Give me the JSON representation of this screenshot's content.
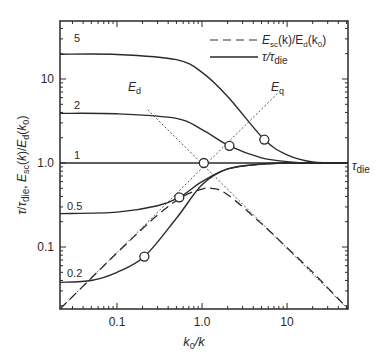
{
  "chart_data": {
    "type": "line",
    "title": "",
    "xlabel": "k0/k",
    "ylabel": "τ/τdie, Esc(k)/Ed(k0)",
    "xscale": "log",
    "yscale": "log",
    "xlim": [
      0.0214,
      52
    ],
    "ylim": [
      0.0183,
      49
    ],
    "grid": false,
    "legend_position": "upper right",
    "x_ticks": [
      {
        "value": 0.1,
        "label": "0.1"
      },
      {
        "value": 1.0,
        "label": "1.0"
      },
      {
        "value": 10,
        "label": "10"
      }
    ],
    "y_ticks": [
      {
        "value": 0.1,
        "label": "0.1"
      },
      {
        "value": 1.0,
        "label": "1.0"
      },
      {
        "value": 10,
        "label": "10"
      }
    ],
    "legend": [
      {
        "label": "Esc(k)/Ed(k0)",
        "style": "dashed"
      },
      {
        "label": "τ/τdie",
        "style": "solid"
      }
    ],
    "series": [
      {
        "name": "τ/τdie (5)",
        "style": "solid",
        "label": "5",
        "initial_value": 19.7,
        "final_value": 1.0,
        "x": [
          0.0214,
          0.1,
          0.5,
          1.0,
          2.0,
          5.4,
          10,
          20,
          52
        ],
        "y": [
          19.7,
          19.6,
          17.0,
          12.0,
          6.2,
          1.9,
          1.25,
          1.03,
          1.0
        ],
        "marker": {
          "x": 5.4,
          "y": 1.9
        }
      },
      {
        "name": "τ/τdie (2)",
        "style": "solid",
        "label": "2",
        "initial_value": 3.9,
        "final_value": 1.0,
        "x": [
          0.0214,
          0.1,
          0.5,
          1.0,
          2.1,
          5,
          10,
          20,
          52
        ],
        "y": [
          3.9,
          3.85,
          3.4,
          2.5,
          1.6,
          1.15,
          1.04,
          1.0,
          1.0
        ],
        "marker": {
          "x": 2.1,
          "y": 1.6
        }
      },
      {
        "name": "τ/τdie (1)",
        "style": "solid",
        "label": "1",
        "initial_value": 1.0,
        "final_value": 1.0,
        "x": [
          0.0214,
          1.0,
          52
        ],
        "y": [
          1.0,
          1.0,
          1.0
        ],
        "marker": {
          "x": 1.05,
          "y": 1.0
        }
      },
      {
        "name": "τ/τdie (0.5)",
        "style": "solid",
        "label": "0.5",
        "initial_value": 0.25,
        "final_value": 1.0,
        "x": [
          0.0214,
          0.1,
          0.3,
          0.54,
          1.0,
          2.0,
          5,
          10,
          52
        ],
        "y": [
          0.25,
          0.26,
          0.31,
          0.39,
          0.6,
          0.85,
          0.97,
          1.0,
          1.0
        ],
        "marker": {
          "x": 0.54,
          "y": 0.39
        }
      },
      {
        "name": "τ/τdie (0.2)",
        "style": "solid",
        "label": "0.2",
        "initial_value": 0.038,
        "final_value": 1.0,
        "x": [
          0.0214,
          0.05,
          0.1,
          0.21,
          0.5,
          1.0,
          2.0,
          5,
          10,
          52
        ],
        "y": [
          0.038,
          0.04,
          0.05,
          0.077,
          0.22,
          0.55,
          0.85,
          0.97,
          1.0,
          1.0
        ],
        "marker": {
          "x": 0.21,
          "y": 0.077
        }
      },
      {
        "name": "Esc(k)/Ed(k0)",
        "style": "dashed",
        "x": [
          0.0214,
          0.1,
          0.3,
          0.6,
          1.0,
          1.3,
          2.0,
          5,
          10,
          20,
          52
        ],
        "y": [
          0.0183,
          0.085,
          0.24,
          0.4,
          0.49,
          0.5,
          0.42,
          0.19,
          0.098,
          0.05,
          0.0183
        ]
      },
      {
        "name": "Ed",
        "style": "dotted",
        "label": "Ed",
        "x": [
          0.23,
          52
        ],
        "y": [
          4.3,
          0.0183
        ]
      },
      {
        "name": "Eq",
        "style": "dotted",
        "label": "Eq",
        "x": [
          0.0214,
          8.0
        ],
        "y": [
          0.0183,
          7.0
        ]
      }
    ],
    "annotations": [
      {
        "text": "τdie",
        "position": "right of y=1.0"
      },
      {
        "text": "Ed",
        "near": [
          0.23,
          5.0
        ]
      },
      {
        "text": "Eq",
        "near": [
          8.0,
          7.5
        ]
      }
    ]
  },
  "labels": {
    "xlabel_main": "k",
    "xlabel_sub": "0",
    "xlabel_tail": "/k",
    "legend_dashed": "E",
    "legend_dashed_sub": "sc",
    "legend_dashed_mid": "(k)/E",
    "legend_dashed_sub2": "d",
    "legend_dashed_tail": "(k",
    "legend_dashed_sub3": "0",
    "legend_dashed_end": ")",
    "legend_solid": "τ/τ",
    "legend_solid_sub": "die",
    "tau_die": "τ",
    "tau_die_sub": "die",
    "ed": "E",
    "ed_sub": "d",
    "eq": "E",
    "eq_sub": "q",
    "curve_5": "5",
    "curve_2": "2",
    "curve_1": "1",
    "curve_05": "0.5",
    "curve_02": "0.2",
    "tick_x_01": "0.1",
    "tick_x_1": "1.0",
    "tick_x_10": "10",
    "tick_y_01": "0.1",
    "tick_y_1": "1.0",
    "tick_y_10": "10"
  },
  "colors": {
    "line": "#2a2a2a",
    "background": "#ffffff"
  }
}
